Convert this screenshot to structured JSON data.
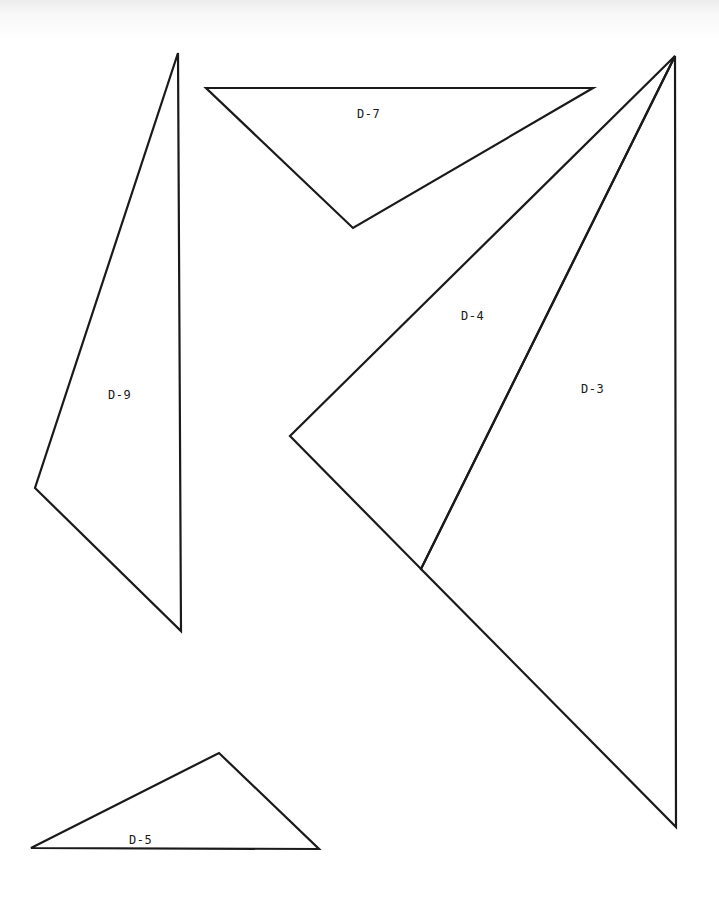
{
  "diagram": {
    "stroke_color": "#1a1a1a",
    "background": "#ffffff",
    "shapes": [
      {
        "id": "D-9",
        "label": "D-9",
        "points": [
          [
            178,
            53
          ],
          [
            181,
            631
          ],
          [
            35,
            488
          ]
        ],
        "label_pos": [
          108,
          388
        ]
      },
      {
        "id": "D-7",
        "label": "D-7",
        "points": [
          [
            206,
            88
          ],
          [
            593,
            88
          ],
          [
            353,
            228
          ]
        ],
        "label_pos": [
          357,
          107
        ]
      },
      {
        "id": "D-4",
        "label": "D-4",
        "points": [
          [
            675,
            56
          ],
          [
            290,
            436
          ],
          [
            421,
            569
          ]
        ],
        "label_pos": [
          461,
          309
        ]
      },
      {
        "id": "D-3",
        "label": "D-3",
        "points": [
          [
            675,
            56
          ],
          [
            676,
            827
          ],
          [
            421,
            569
          ]
        ],
        "label_pos": [
          581,
          382
        ]
      },
      {
        "id": "D-5",
        "label": "D-5",
        "points": [
          [
            31,
            848
          ],
          [
            219,
            753
          ],
          [
            319,
            849
          ]
        ],
        "label_pos": [
          129,
          833
        ]
      }
    ]
  }
}
